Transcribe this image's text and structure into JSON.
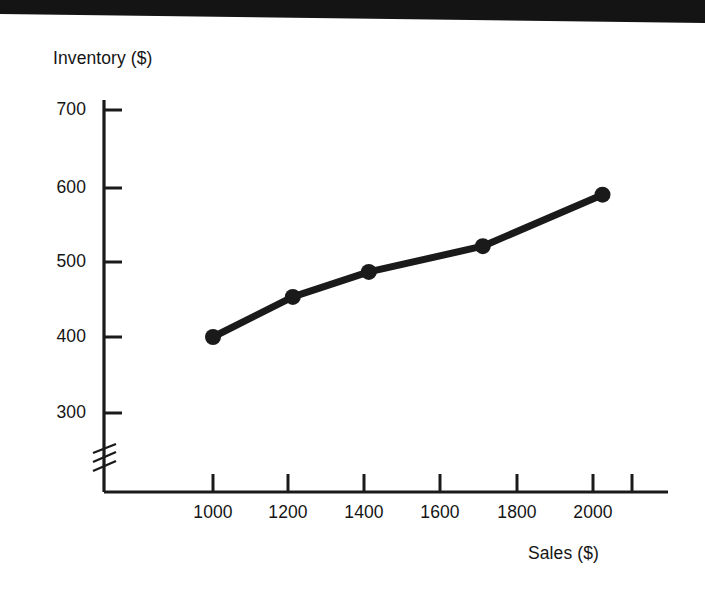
{
  "figure": {
    "background_color": "#ffffff",
    "ink_color": "#1a1a1a",
    "artifact_color": "#151515",
    "has_top_scan_artifact": true
  },
  "axes": {
    "y_title": "Inventory ($)",
    "x_title": "Sales ($)",
    "y_ticks": [
      "300",
      "400",
      "500",
      "600",
      "700"
    ],
    "x_ticks": [
      "1000",
      "1200",
      "1400",
      "1600",
      "1800",
      "2000"
    ],
    "y_axis_break_symbol": "zigzag-break",
    "y_axis_break_label": "axis-break"
  },
  "chart_data": {
    "type": "line",
    "title": "",
    "subtitle": "",
    "xlabel": "Sales ($)",
    "ylabel": "Inventory ($)",
    "xlim": [
      900,
      2150
    ],
    "ylim": [
      260,
      740
    ],
    "y_axis_broken": true,
    "y_axis_break_below": 300,
    "grid": false,
    "legend": false,
    "legend_position": "none",
    "xticks": [
      1000,
      1200,
      1400,
      1600,
      1800,
      2000
    ],
    "yticks": [
      300,
      400,
      500,
      600,
      700
    ],
    "marker": "filled-circle",
    "series": [
      {
        "name": "Inventory vs Sales",
        "x": [
          1000,
          1210,
          1410,
          1710,
          2025
        ],
        "y": [
          400,
          453,
          486,
          520,
          588
        ]
      }
    ],
    "points": [
      {
        "x": 1000,
        "y": 400
      },
      {
        "x": 1210,
        "y": 453
      },
      {
        "x": 1410,
        "y": 486
      },
      {
        "x": 1710,
        "y": 520
      },
      {
        "x": 2025,
        "y": 588
      }
    ]
  }
}
